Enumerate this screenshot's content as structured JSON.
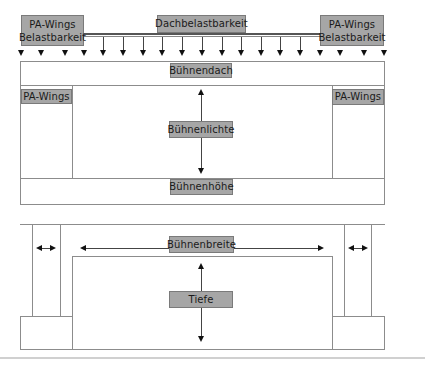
{
  "diagram": {
    "top": {
      "labels": {
        "pa_wings_left_line1": "PA-Wings",
        "pa_wings_left_line2": "Belastbarkeit",
        "roof_load": "Dachbelastbarkeit",
        "pa_wings_right_line1": "PA-Wings",
        "pa_wings_right_line2": "Belastbarkeit",
        "stage_roof": "Bühnendach",
        "wing_left": "PA-Wings",
        "wing_right": "PA-Wings",
        "clearance": "Bühnenlichte",
        "stage_height": "Bühnenhöhe"
      },
      "load_arrow_count": 19
    },
    "bottom": {
      "labels": {
        "stage_width": "Bühnenbreite",
        "depth": "Tiefe"
      }
    },
    "colors": {
      "label_fill": "#a6a6a6",
      "label_border": "#7a7a7a",
      "outline": "#8c8c8c",
      "arrow": "#111111"
    }
  }
}
